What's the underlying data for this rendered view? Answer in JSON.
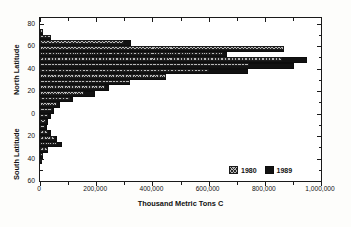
{
  "chart_data": {
    "type": "bar",
    "orientation": "horizontal",
    "title": "Total CO2 Emissions Summed By Latitude",
    "title_parts": {
      "pre": "Total CO",
      "sub": "2",
      "post": " Emissions Summed By Latitude"
    },
    "xlabel": "Thousand Metric Tons C",
    "ylabel_north": "North Latitude",
    "ylabel_south": "South Latitude",
    "xlim": [
      0,
      1000000
    ],
    "xticks": [
      0,
      200000,
      400000,
      600000,
      800000,
      1000000
    ],
    "xticklabels": [
      "0",
      "200,000",
      "400,000",
      "600,000",
      "800,000",
      "1,000,000"
    ],
    "ylim": [
      -60,
      85
    ],
    "yticks": [
      80,
      60,
      40,
      20,
      0,
      -20,
      -40,
      -60
    ],
    "yticklabels": [
      "80",
      "60",
      "40",
      "20",
      "0",
      "20",
      "40",
      "60"
    ],
    "grid": false,
    "legend_position": "lower-right",
    "categories": [
      70,
      65,
      60,
      55,
      50,
      45,
      40,
      35,
      30,
      25,
      20,
      15,
      10,
      5,
      0,
      -5,
      -10,
      -15,
      -20,
      -25,
      -30,
      -35,
      -40,
      -45
    ],
    "category_labels": [
      "70N",
      "65N",
      "60N",
      "55N",
      "50N",
      "45N",
      "40N",
      "35N",
      "30N",
      "25N",
      "20N",
      "15N",
      "10N",
      "5N",
      "0",
      "5S",
      "10S",
      "15S",
      "20S",
      "25S",
      "30S",
      "35S",
      "40S",
      "45S"
    ],
    "series": [
      {
        "name": "1980",
        "color": "#b9b9b9",
        "pattern": "crosshatch",
        "values": [
          9000,
          38000,
          300000,
          870000,
          650000,
          860000,
          745000,
          600000,
          450000,
          320000,
          230000,
          155000,
          105000,
          60000,
          42000,
          30000,
          22000,
          18000,
          30000,
          52000,
          60000,
          28000,
          9000,
          3000
        ]
      },
      {
        "name": "1989",
        "color": "#121212",
        "pattern": "solid",
        "values": [
          9000,
          38000,
          325000,
          870000,
          665000,
          950000,
          905000,
          740000,
          450000,
          320000,
          245000,
          195000,
          118000,
          72000,
          50000,
          40000,
          30000,
          26000,
          40000,
          62000,
          77000,
          30000,
          9000,
          3000
        ]
      }
    ]
  },
  "legend": {
    "items": [
      {
        "label": "1980",
        "series": "1980"
      },
      {
        "label": "1989",
        "series": "1989"
      }
    ]
  }
}
